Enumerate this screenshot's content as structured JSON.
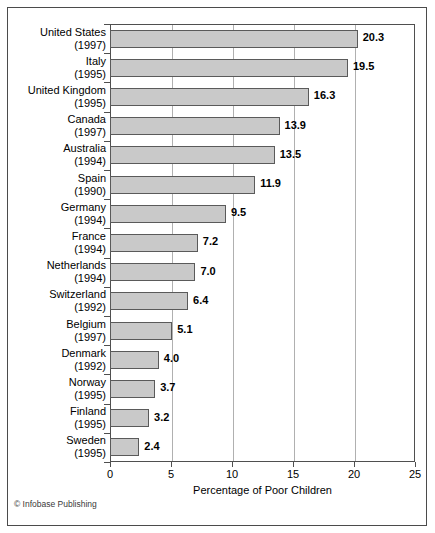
{
  "credit": "© Infobase Publishing",
  "chart_data": {
    "type": "bar",
    "orientation": "horizontal",
    "title": "",
    "xlabel": "Percentage of Poor Children",
    "ylabel": "",
    "xlim": [
      0,
      25
    ],
    "xticks": [
      0,
      5,
      10,
      15,
      20,
      25
    ],
    "xticklabels": [
      "0",
      "5",
      "10",
      "15",
      "20",
      "25"
    ],
    "grid": "vertical gridlines at each x tick",
    "legend": "none",
    "bar_color": "#c9c9c9",
    "bar_edge_color": "#5a5a5a",
    "categories": [
      "United States (1997)",
      "Italy (1995)",
      "United Kingdom (1995)",
      "Canada (1997)",
      "Australia (1994)",
      "Spain (1990)",
      "Germany (1994)",
      "France (1994)",
      "Netherlands (1994)",
      "Switzerland (1992)",
      "Belgium (1997)",
      "Denmark (1992)",
      "Norway (1995)",
      "Finland (1995)",
      "Sweden (1995)"
    ],
    "values": [
      20.3,
      19.5,
      16.3,
      13.9,
      13.5,
      11.9,
      9.5,
      7.2,
      7.0,
      6.4,
      5.1,
      4.0,
      3.7,
      3.2,
      2.4
    ],
    "rows": [
      {
        "country": "United States",
        "year": "(1997)",
        "value": 20.3,
        "label": "20.3"
      },
      {
        "country": "Italy",
        "year": "(1995)",
        "value": 19.5,
        "label": "19.5"
      },
      {
        "country": "United Kingdom",
        "year": "(1995)",
        "value": 16.3,
        "label": "16.3"
      },
      {
        "country": "Canada",
        "year": "(1997)",
        "value": 13.9,
        "label": "13.9"
      },
      {
        "country": "Australia",
        "year": "(1994)",
        "value": 13.5,
        "label": "13.5"
      },
      {
        "country": "Spain",
        "year": "(1990)",
        "value": 11.9,
        "label": "11.9"
      },
      {
        "country": "Germany",
        "year": "(1994)",
        "value": 9.5,
        "label": "9.5"
      },
      {
        "country": "France",
        "year": "(1994)",
        "value": 7.2,
        "label": "7.2"
      },
      {
        "country": "Netherlands",
        "year": "(1994)",
        "value": 7.0,
        "label": "7.0"
      },
      {
        "country": "Switzerland",
        "year": "(1992)",
        "value": 6.4,
        "label": "6.4"
      },
      {
        "country": "Belgium",
        "year": "(1997)",
        "value": 5.1,
        "label": "5.1"
      },
      {
        "country": "Denmark",
        "year": "(1992)",
        "value": 4.0,
        "label": "4.0"
      },
      {
        "country": "Norway",
        "year": "(1995)",
        "value": 3.7,
        "label": "3.7"
      },
      {
        "country": "Finland",
        "year": "(1995)",
        "value": 3.2,
        "label": "3.2"
      },
      {
        "country": "Sweden",
        "year": "(1995)",
        "value": 2.4,
        "label": "2.4"
      }
    ]
  }
}
